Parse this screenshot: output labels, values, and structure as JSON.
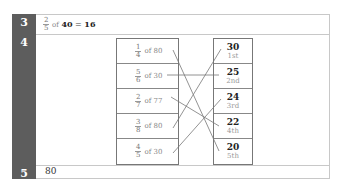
{
  "rows": [
    {
      "number": "3",
      "equation": {
        "numerator": "2",
        "denominator": "5",
        "of_label": "of",
        "whole": "40",
        "equals": "=",
        "result": "16"
      }
    },
    {
      "number": "4",
      "matching": {
        "left": [
          {
            "numerator": "1",
            "denominator": "4",
            "of_label": "of",
            "whole": "80"
          },
          {
            "numerator": "5",
            "denominator": "6",
            "of_label": "of",
            "whole": "30"
          },
          {
            "numerator": "2",
            "denominator": "7",
            "of_label": "of",
            "whole": "77"
          },
          {
            "numerator": "3",
            "denominator": "8",
            "of_label": "of",
            "whole": "80"
          },
          {
            "numerator": "4",
            "denominator": "5",
            "of_label": "of",
            "whole": "30"
          }
        ],
        "right": [
          {
            "value": "30",
            "ordinal": "1st"
          },
          {
            "value": "25",
            "ordinal": "2nd"
          },
          {
            "value": "24",
            "ordinal": "3rd"
          },
          {
            "value": "22",
            "ordinal": "4th"
          },
          {
            "value": "20",
            "ordinal": "5th"
          }
        ],
        "connections": [
          [
            0,
            4
          ],
          [
            1,
            1
          ],
          [
            2,
            3
          ],
          [
            3,
            0
          ],
          [
            4,
            2
          ]
        ]
      }
    },
    {
      "number": "5",
      "answer": "80"
    }
  ],
  "colors": {
    "number_column": "#5d5d5d",
    "border": "#c8c8c8",
    "line": "#777777"
  }
}
